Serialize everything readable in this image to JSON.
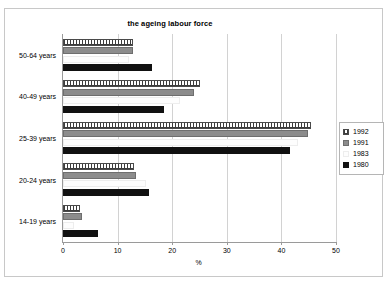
{
  "chart_data": {
    "type": "bar",
    "orientation": "horizontal",
    "title": "the ageing labour force",
    "xlabel": "%",
    "ylabel": "",
    "xlim": [
      0,
      50
    ],
    "xticks": [
      0,
      10,
      20,
      30,
      40,
      50
    ],
    "grid": "vertical",
    "legend_position": "right",
    "categories": [
      "14-19 years",
      "20-24 years",
      "25-39 years",
      "40-49 years",
      "50-64 years"
    ],
    "series": [
      {
        "name": "1992",
        "color": "#ffffff",
        "pattern": "dotted-outline",
        "values": [
          3.1,
          13.0,
          45.5,
          25.0,
          12.8
        ]
      },
      {
        "name": "1991",
        "color": "#8c8c8c",
        "pattern": "solid-gray",
        "values": [
          3.5,
          13.3,
          44.8,
          24.0,
          12.8
        ]
      },
      {
        "name": "1983",
        "color": "#fdfdfd",
        "pattern": "white",
        "values": [
          2.0,
          15.2,
          43.0,
          21.5,
          12.0
        ]
      },
      {
        "name": "1980",
        "color": "#111111",
        "pattern": "solid-black",
        "values": [
          6.5,
          15.8,
          41.5,
          18.5,
          16.3
        ]
      }
    ]
  },
  "legend": {
    "entries": [
      {
        "label": "1992"
      },
      {
        "label": "1991"
      },
      {
        "label": "1983"
      },
      {
        "label": "1980"
      }
    ]
  },
  "axis": {
    "x_tick_labels": [
      "0",
      "10",
      "20",
      "30",
      "40",
      "50"
    ],
    "x_axis_title": "%"
  }
}
